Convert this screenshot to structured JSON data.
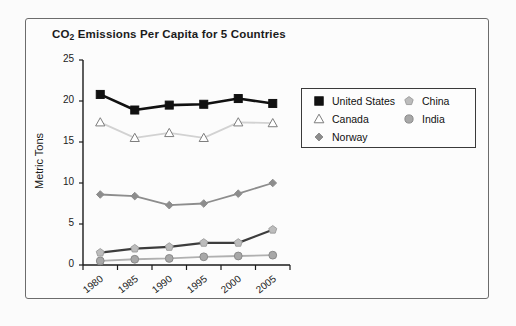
{
  "chart_data": {
    "type": "line",
    "title": "CO2 Emissions Per Capita for 5 Countries",
    "title_main": "CO",
    "title_sub": "2",
    "title_rest": " Emissions Per Capita for 5 Countries",
    "xlabel": "",
    "ylabel": "Metric Tons",
    "categories": [
      "1980",
      "1985",
      "1990",
      "1995",
      "2000",
      "2005"
    ],
    "x": [
      1980,
      1985,
      1990,
      1995,
      2000,
      2005
    ],
    "ylim": [
      0,
      25
    ],
    "yticks": [
      0,
      5,
      10,
      15,
      20,
      25
    ],
    "grid": false,
    "legend_position": "right",
    "series": [
      {
        "name": "United States",
        "values": [
          20.8,
          18.9,
          19.5,
          19.6,
          20.3,
          19.7
        ],
        "color": "#111111",
        "marker": "square",
        "marker_fill": "#111111"
      },
      {
        "name": "Canada",
        "values": [
          17.4,
          15.5,
          16.1,
          15.5,
          17.4,
          17.3
        ],
        "color": "#d2d2d2",
        "marker": "triangle",
        "marker_fill": "#ffffff"
      },
      {
        "name": "Norway",
        "values": [
          8.6,
          8.4,
          7.3,
          7.5,
          8.7,
          10.0
        ],
        "color": "#8d8d8d",
        "marker": "diamond",
        "marker_fill": "#8d8d8d"
      },
      {
        "name": "China",
        "values": [
          1.5,
          2.0,
          2.2,
          2.7,
          2.7,
          4.3
        ],
        "color": "#3d3d3d",
        "marker": "pentagon",
        "marker_fill": "#bcbcbc"
      },
      {
        "name": "India",
        "values": [
          0.5,
          0.7,
          0.8,
          1.0,
          1.1,
          1.2
        ],
        "color": "#b0b0b0",
        "marker": "circle",
        "marker_fill": "#a8a8a8"
      }
    ]
  },
  "legend": {
    "entries": [
      {
        "label": "United States"
      },
      {
        "label": "Canada"
      },
      {
        "label": "Norway"
      },
      {
        "label": "China"
      },
      {
        "label": "India"
      }
    ]
  },
  "axes": {
    "y_axis_label": "Metric Tons",
    "y_tick_labels": [
      "0",
      "5",
      "10",
      "15",
      "20",
      "25"
    ],
    "x_tick_labels": [
      "1980",
      "1985",
      "1990",
      "1995",
      "2000",
      "2005"
    ]
  },
  "colors": {
    "frame": "#6c6c6c",
    "axis": "#1b1b1b",
    "background": "#fbfbfb",
    "legend_border": "#3a3a3a"
  }
}
